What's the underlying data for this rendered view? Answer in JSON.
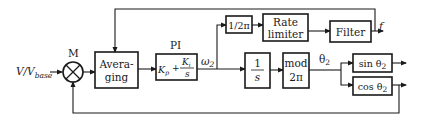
{
  "diagram": {
    "input": {
      "label_main": "V/V",
      "label_sub": "base"
    },
    "multiplier": {
      "label": "M",
      "symbol": "⊗"
    },
    "blocks": {
      "averaging": {
        "line1": "Avera-",
        "line2": "ging"
      },
      "pi": {
        "title": "PI",
        "kp": "K",
        "kp_sub": "p",
        "plus": "+",
        "ki": "K",
        "ki_sub": "i",
        "s": "s"
      },
      "inv_2pi": {
        "label": "1/2π"
      },
      "rate_limiter": {
        "line1": "Rate",
        "line2": "limiter"
      },
      "filter": {
        "label": "Filter"
      },
      "integrator": {
        "num": "1",
        "den": "s"
      },
      "mod": {
        "line1": "mod",
        "line2": "2π"
      },
      "sin": {
        "label": "sin θ",
        "sub": "2"
      },
      "cos": {
        "label": "cos θ",
        "sub": "2"
      }
    },
    "signals": {
      "omega": {
        "label": "ω",
        "sub": "2"
      },
      "theta": {
        "label": "θ",
        "sub": "2"
      },
      "frequency": {
        "label": "f"
      }
    }
  }
}
